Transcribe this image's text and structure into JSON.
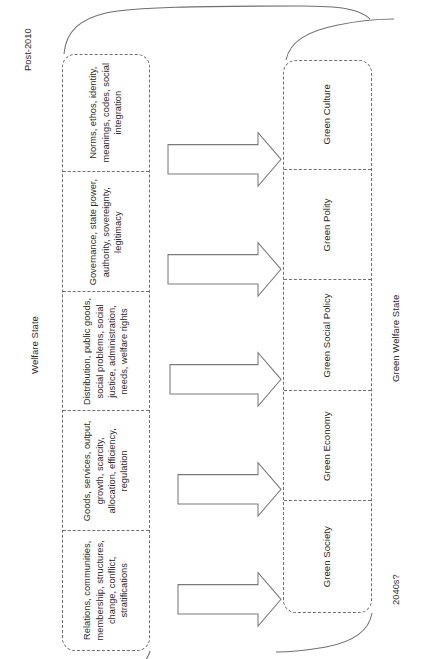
{
  "diagram": {
    "type": "transition-diagram",
    "orientation": "rotated-90-counterclockwise",
    "colors": {
      "stroke": "#6f6f6f",
      "arrow_stroke": "#7a7a7a",
      "text": "#2b2b2b",
      "background": "#ffffff"
    }
  },
  "eras": {
    "start_label": "Post-2010",
    "end_label": "2040s?"
  },
  "top_group": {
    "brace_label": "Welfare State",
    "cells": [
      {
        "id": "society",
        "text": "Relations, communities, membership, structures, change, conflict, stratifications"
      },
      {
        "id": "economy",
        "text": "Goods, services, output, growth, scarcity, allocation, efficiency, regulation"
      },
      {
        "id": "social-policy",
        "text": "Distribution, public goods, social problems, social justice, administration, needs, welfare rights"
      },
      {
        "id": "polity",
        "text": "Governance, state power, authority, sovereignty, legitimacy"
      },
      {
        "id": "culture",
        "text": "Norms, ethos, identity, meanings, codes, social integration"
      }
    ]
  },
  "bottom_group": {
    "brace_label": "Green Welfare State",
    "cells": [
      {
        "id": "green-society",
        "text": "Green Society"
      },
      {
        "id": "green-economy",
        "text": "Green Economy"
      },
      {
        "id": "green-social-policy",
        "text": "Green Social Policy"
      },
      {
        "id": "green-polity",
        "text": "Green Polity"
      },
      {
        "id": "green-culture",
        "text": "Green Culture"
      }
    ]
  },
  "arrows": {
    "count": 5,
    "direction": "down",
    "semantic": "transition-arrow"
  }
}
